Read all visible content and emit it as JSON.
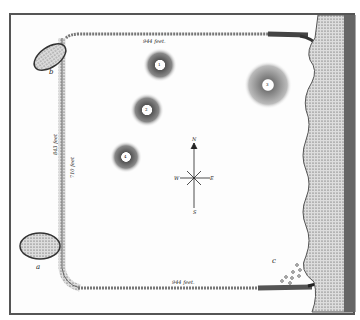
{
  "map": {
    "type": "historical earthwork survey plan",
    "labels": {
      "top_wall": "944 feet.",
      "bottom_wall": "944 feet.",
      "left_outer": "843 feet",
      "left_inner": "710 feet"
    },
    "letters": {
      "a": "a",
      "b": "b",
      "c": "c"
    },
    "mounds": [
      {
        "id": "1",
        "label": "1"
      },
      {
        "id": "2",
        "label": "2"
      },
      {
        "id": "3",
        "label": "3"
      },
      {
        "id": "4",
        "label": "4"
      }
    ],
    "compass": {
      "n": "N",
      "s": "S",
      "e": "E",
      "w": "W"
    }
  }
}
